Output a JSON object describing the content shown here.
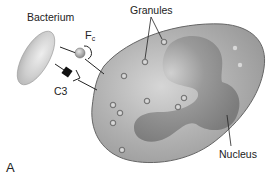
{
  "figure": {
    "panel_label": "A",
    "labels": {
      "bacterium": "Bacterium",
      "fc_main": "F",
      "fc_sub": "c",
      "c3": "C3",
      "granules": "Granules",
      "nucleus": "Nucleus"
    },
    "colors": {
      "cell_fill": "#a9a9a9",
      "cell_stroke": "#555555",
      "nucleus_fill": "#8e8e8e",
      "bacterium_fill": "#c8c8c8",
      "c3_fill": "#111111",
      "line": "#222222"
    }
  }
}
